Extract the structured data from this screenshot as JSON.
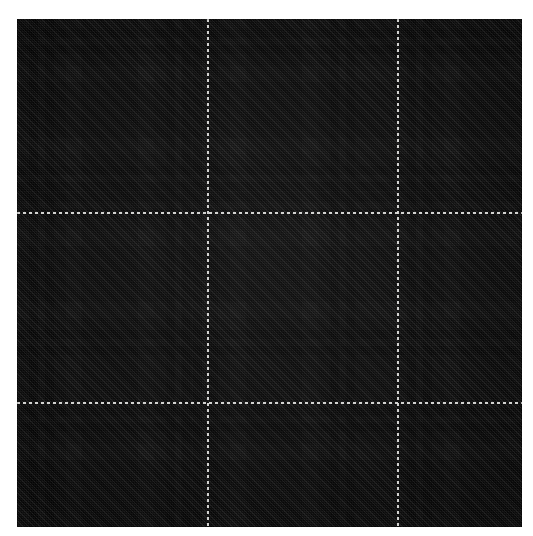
{
  "image": {
    "title": "Tartan plaid fabric swatch",
    "subject": "charcoal grey and black check woven wool",
    "weave": "2/2 twill",
    "twill_direction": "bottom-left to top-right",
    "canvas_width": 533,
    "canvas_height": 536,
    "background_color": "#ffffff",
    "swatch": {
      "left": 17,
      "top": 19,
      "width": 505,
      "height": 508
    }
  },
  "palette": {
    "black": "#0c0c0c",
    "near_black": "#141414",
    "dark_charcoal": "#2a2a2a",
    "charcoal": "#323232",
    "mid_grey": "#3c3c3c",
    "grey": "#474747",
    "light_grey": "#565656",
    "pale_grey": "#6a6a6a",
    "accent_white": "#e2e2e0"
  },
  "sett": {
    "description": "Symmetric tartan sett; identical stripe sequence used for warp (vertical) and weft (horizontal).",
    "repeat_px": 190,
    "pivot_symmetric": true,
    "stripes": [
      {
        "color_key": "charcoal",
        "color": "#323232",
        "width": 26,
        "name": "ground-charcoal"
      },
      {
        "color_key": "black",
        "color": "#0c0c0c",
        "width": 9,
        "name": "black-guard"
      },
      {
        "color_key": "grey",
        "color": "#474747",
        "width": 7,
        "name": "grey-pin"
      },
      {
        "color_key": "black",
        "color": "#0c0c0c",
        "width": 9,
        "name": "black-guard"
      },
      {
        "color_key": "charcoal",
        "color": "#323232",
        "width": 12,
        "name": "ground-charcoal"
      },
      {
        "color_key": "light_grey",
        "color": "#565656",
        "width": 16,
        "name": "light-band"
      },
      {
        "color_key": "dark_charcoal",
        "color": "#2a2a2a",
        "width": 56,
        "name": "centre-block"
      },
      {
        "color_key": "light_grey",
        "color": "#565656",
        "width": 16,
        "name": "light-band"
      },
      {
        "color_key": "charcoal",
        "color": "#323232",
        "width": 12,
        "name": "ground-charcoal"
      },
      {
        "color_key": "black",
        "color": "#0c0c0c",
        "width": 9,
        "name": "black-guard"
      },
      {
        "color_key": "grey",
        "color": "#474747",
        "width": 7,
        "name": "grey-pin"
      },
      {
        "color_key": "black",
        "color": "#0c0c0c",
        "width": 9,
        "name": "black-guard"
      },
      {
        "color_key": "charcoal",
        "color": "#323232",
        "width": 2,
        "name": "ground-charcoal"
      }
    ]
  },
  "accent_lines": {
    "style": "dashed hairline",
    "color": "#e2e2e0",
    "thickness_px": 2,
    "dash_px": 3,
    "gap_px": 3,
    "vertical_x": [
      207,
      397
    ],
    "horizontal_y": [
      212,
      402
    ]
  },
  "labels": {
    "swatch_name": "Tartan swatch",
    "warp_name": "Warp stripes (vertical)",
    "weft_name": "Weft stripes (horizontal)",
    "twill_name": "Twill texture",
    "weave_name": "Weave texture",
    "shade_name": "Cloth shading"
  }
}
